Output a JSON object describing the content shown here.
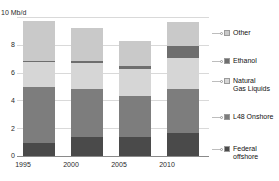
{
  "chart_data": {
    "type": "bar",
    "stacked": true,
    "title": "",
    "subtitle": "",
    "xlabel": "",
    "ylabel": "",
    "unit_label": "10 Mb/d",
    "categories": [
      "1995",
      "2000",
      "2005",
      "2010"
    ],
    "ylim": [
      0,
      10
    ],
    "yticks": [
      "0",
      "2",
      "4",
      "6",
      "8",
      "10"
    ],
    "ytick_values": [
      0,
      2,
      4,
      6,
      8,
      10
    ],
    "grid": true,
    "legend_position": "right",
    "series": [
      {
        "name": "Federal offshore",
        "label": "Federal\noffshore",
        "color": "#4a4a4a",
        "values": [
          0.95,
          1.4,
          1.35,
          1.65
        ]
      },
      {
        "name": "L48 Onshore",
        "label": "L48 Onshore",
        "color": "#7d7d7d",
        "values": [
          4.05,
          3.4,
          3.0,
          3.2
        ]
      },
      {
        "name": "Natural Gas Liquids",
        "label": "Natural\nGas Liquids",
        "color": "#d6d6d6",
        "values": [
          1.75,
          1.9,
          1.9,
          2.2
        ]
      },
      {
        "name": "Ethanol",
        "label": "Ethanol",
        "color": "#6e6e6e",
        "values": [
          0.12,
          0.12,
          0.2,
          0.85
        ]
      },
      {
        "name": "Other",
        "label": "Other",
        "color": "#c9c9c9",
        "values": [
          2.83,
          2.38,
          1.85,
          1.75
        ]
      }
    ],
    "totals": [
      9.7,
      9.2,
      8.3,
      9.65
    ]
  },
  "colors": {
    "federal_offshore": "#4a4a4a",
    "l48_onshore": "#7d7d7d",
    "natural_gas_liquids": "#d6d6d6",
    "ethanol": "#6e6e6e",
    "other": "#c9c9c9",
    "grid": "#d9d9d9",
    "axis": "#8a8a8a",
    "text": "#2a2a2a"
  }
}
